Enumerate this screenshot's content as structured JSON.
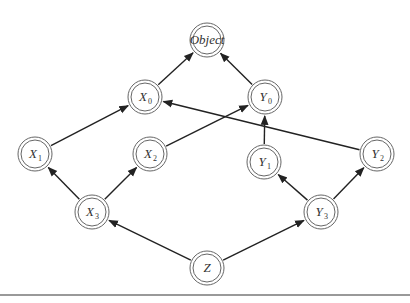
{
  "diagram": {
    "type": "class-hierarchy",
    "nodes": [
      {
        "id": "Object",
        "base": "Object",
        "sub": "",
        "x": 207,
        "y": 40
      },
      {
        "id": "X0",
        "base": "X",
        "sub": "0",
        "x": 145,
        "y": 97
      },
      {
        "id": "Y0",
        "base": "Y",
        "sub": "0",
        "x": 265,
        "y": 97
      },
      {
        "id": "X1",
        "base": "X",
        "sub": "1",
        "x": 35,
        "y": 154
      },
      {
        "id": "X2",
        "base": "X",
        "sub": "2",
        "x": 150,
        "y": 154
      },
      {
        "id": "Y1",
        "base": "Y",
        "sub": "1",
        "x": 264,
        "y": 162
      },
      {
        "id": "Y2",
        "base": "Y",
        "sub": "2",
        "x": 377,
        "y": 154
      },
      {
        "id": "X3",
        "base": "X",
        "sub": "3",
        "x": 92,
        "y": 212
      },
      {
        "id": "Y3",
        "base": "Y",
        "sub": "3",
        "x": 321,
        "y": 212
      },
      {
        "id": "Z",
        "base": "Z",
        "sub": "",
        "x": 207,
        "y": 268
      }
    ],
    "edges": [
      {
        "from": "X0",
        "to": "Object"
      },
      {
        "from": "Y0",
        "to": "Object"
      },
      {
        "from": "X1",
        "to": "X0"
      },
      {
        "from": "Y2",
        "to": "X0"
      },
      {
        "from": "X2",
        "to": "Y0"
      },
      {
        "from": "Y1",
        "to": "Y0"
      },
      {
        "from": "X3",
        "to": "X1"
      },
      {
        "from": "X3",
        "to": "X2"
      },
      {
        "from": "Y3",
        "to": "Y1"
      },
      {
        "from": "Y3",
        "to": "Y2"
      },
      {
        "from": "Z",
        "to": "X3"
      },
      {
        "from": "Z",
        "to": "Y3"
      }
    ],
    "colors": {
      "stroke": "#222222",
      "node_stroke": "#666666",
      "rule": "#999999"
    }
  }
}
